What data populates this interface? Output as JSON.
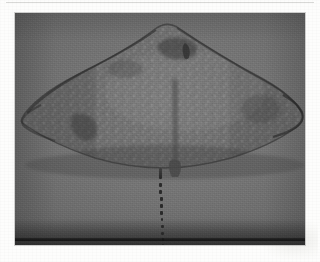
{
  "page": {
    "background_color": "#fdfdfc",
    "top_rule_color": "#d8d8d6"
  },
  "plate": {
    "caption": "",
    "frame": {
      "x": 15,
      "y": 13,
      "width": 290,
      "height": 232
    },
    "background_color": "#757575",
    "floor_shadow_color": "#1e1e1e",
    "grain": "film-grain"
  },
  "specimen": {
    "name": "ray-specimen",
    "view": "dorsal",
    "body_color": "#6a6a6a",
    "outline_color": "#3c3c3c",
    "speckle_color": "#9a9a9a",
    "disc": {
      "center_x": 160,
      "apex_y": 20,
      "left_tip_x": 22,
      "right_tip_x": 300,
      "widest_y": 92,
      "trailing_edge_y": 163
    },
    "markings": [
      {
        "name": "snout-marking",
        "x": 168,
        "y": 34
      },
      {
        "name": "left-wing-marking",
        "x": 73,
        "y": 115
      },
      {
        "name": "midline-shadow",
        "x": 160,
        "y": 120
      }
    ],
    "tail": {
      "name": "whip-tail",
      "color": "#2a2a2a",
      "start_y": 166,
      "end_y": 239,
      "center_x": 160,
      "dot_count": 11
    }
  }
}
